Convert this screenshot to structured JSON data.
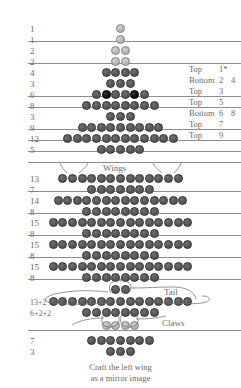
{
  "page": {
    "caption_line1": "Craft the left wing",
    "caption_line2": "as a mirror image"
  },
  "annotations": {
    "wings": "Wings",
    "tail": "Tail",
    "claws": "Claws"
  },
  "colors": {
    "bead_dark": "#585858",
    "bead_black": "#121212",
    "bead_light": "#b8b8b8",
    "rule": "#8d8d8d",
    "text": "#6a6a6a",
    "background": "#ffffff"
  },
  "rows": [
    {
      "count_label": "1",
      "beads": [
        "light"
      ],
      "y": 24,
      "cx": 120.5,
      "rule_below": false
    },
    {
      "count_label": "1",
      "beads": [
        "light"
      ],
      "y": 35,
      "cx": 120.5,
      "rule_below": true
    },
    {
      "count_label": "2",
      "beads": [
        "light",
        "light"
      ],
      "y": 46,
      "cx": 120.5,
      "rule_below": false
    },
    {
      "count_label": "2",
      "beads": [
        "light",
        "light"
      ],
      "y": 57,
      "cx": 120.5,
      "rule_below": true
    },
    {
      "count_label": "4",
      "beads": [
        "dark",
        "dark",
        "dark",
        "dark"
      ],
      "y": 68,
      "cx": 120.5,
      "rule_below": false
    },
    {
      "count_label": "3",
      "beads": [
        "dark",
        "dark",
        "dark"
      ],
      "y": 79,
      "cx": 120.5,
      "rule_below": false
    },
    {
      "count_label": "6",
      "beads": [
        "dark",
        "black",
        "dark",
        "dark",
        "black",
        "dark"
      ],
      "y": 90,
      "cx": 120.5,
      "rule_below": true
    },
    {
      "count_label": "8",
      "beads": [
        "dark",
        "dark",
        "dark",
        "dark",
        "dark",
        "dark",
        "dark",
        "dark"
      ],
      "y": 101,
      "cx": 120.5,
      "rule_below": false
    },
    {
      "count_label": "3",
      "beads": [
        "dark",
        "dark",
        "dark"
      ],
      "y": 112,
      "cx": 120.5,
      "rule_below": false
    },
    {
      "count_label": "9",
      "beads": [
        "dark",
        "dark",
        "dark",
        "dark",
        "dark",
        "dark",
        "dark",
        "dark",
        "dark"
      ],
      "y": 123,
      "cx": 120.5,
      "rule_below": true
    },
    {
      "count_label": "12",
      "beads": [
        "dark",
        "dark",
        "dark",
        "dark",
        "dark",
        "dark",
        "dark",
        "dark",
        "dark",
        "dark",
        "dark",
        "dark"
      ],
      "y": 134,
      "cx": 120.5,
      "rule_below": false
    },
    {
      "count_label": "5",
      "beads": [
        "dark",
        "dark",
        "dark",
        "dark",
        "dark"
      ],
      "y": 145,
      "cx": 120.5,
      "rule_below": true
    },
    {
      "count_label": "13",
      "beads": [
        "dark",
        "dark",
        "dark",
        "dark",
        "dark",
        "dark",
        "dark",
        "dark",
        "dark",
        "dark",
        "dark",
        "dark",
        "dark"
      ],
      "y": 174,
      "cx": 120.5,
      "rule_below": false
    },
    {
      "count_label": "7",
      "beads": [
        "dark",
        "dark",
        "dark",
        "dark",
        "dark",
        "dark",
        "dark"
      ],
      "y": 185,
      "cx": 120.5,
      "rule_below": true
    },
    {
      "count_label": "14",
      "beads": [
        "dark",
        "dark",
        "dark",
        "dark",
        "dark",
        "dark",
        "dark",
        "dark",
        "dark",
        "dark",
        "dark",
        "dark",
        "dark",
        "dark"
      ],
      "y": 196,
      "cx": 120.5,
      "rule_below": false
    },
    {
      "count_label": "8",
      "beads": [
        "dark",
        "dark",
        "dark",
        "dark",
        "dark",
        "dark",
        "dark",
        "dark"
      ],
      "y": 207,
      "cx": 120.5,
      "rule_below": true
    },
    {
      "count_label": "15",
      "beads": [
        "dark",
        "dark",
        "dark",
        "dark",
        "dark",
        "dark",
        "dark",
        "dark",
        "dark",
        "dark",
        "dark",
        "dark",
        "dark",
        "dark",
        "dark"
      ],
      "y": 218,
      "cx": 120.5,
      "rule_below": false
    },
    {
      "count_label": "8",
      "beads": [
        "dark",
        "dark",
        "dark",
        "dark",
        "dark",
        "dark",
        "dark",
        "dark"
      ],
      "y": 229,
      "cx": 120.5,
      "rule_below": true
    },
    {
      "count_label": "15",
      "beads": [
        "dark",
        "dark",
        "dark",
        "dark",
        "dark",
        "dark",
        "dark",
        "dark",
        "dark",
        "dark",
        "dark",
        "dark",
        "dark",
        "dark",
        "dark"
      ],
      "y": 240,
      "cx": 120.5,
      "rule_below": false
    },
    {
      "count_label": "8",
      "beads": [
        "dark",
        "dark",
        "dark",
        "dark",
        "dark",
        "dark",
        "dark",
        "dark"
      ],
      "y": 251,
      "cx": 120.5,
      "rule_below": true
    },
    {
      "count_label": "15",
      "beads": [
        "dark",
        "dark",
        "dark",
        "dark",
        "dark",
        "dark",
        "dark",
        "dark",
        "dark",
        "dark",
        "dark",
        "dark",
        "dark",
        "dark",
        "dark"
      ],
      "y": 262,
      "cx": 120.5,
      "rule_below": false
    },
    {
      "count_label": "8",
      "beads": [
        "dark",
        "dark",
        "dark",
        "dark",
        "dark",
        "dark",
        "dark",
        "dark"
      ],
      "y": 273,
      "cx": 120.5,
      "rule_below": true
    },
    {
      "count_label": "",
      "beads": [
        "dark",
        "dark"
      ],
      "y": 285,
      "cx": 120.5,
      "rule_below": false
    },
    {
      "count_label": "13+2",
      "beads": [
        "dark",
        "dark",
        "dark",
        "dark",
        "dark",
        "dark",
        "dark",
        "dark",
        "dark",
        "dark",
        "dark",
        "dark",
        "dark",
        "dark",
        "dark"
      ],
      "y": 297,
      "cx": 120.5,
      "rule_below": false
    },
    {
      "count_label": "6+2+2",
      "beads": [
        "dark",
        "dark",
        "dark",
        "dark",
        "dark",
        "dark",
        "dark",
        "dark"
      ],
      "y": 308,
      "cx": 120.5,
      "rule_below": false
    },
    {
      "count_label": "",
      "beads": [
        "light",
        "light",
        "light",
        "light"
      ],
      "y": 321,
      "cx": 120.5,
      "rule_below": true
    },
    {
      "count_label": "7",
      "beads": [
        "dark",
        "dark",
        "dark",
        "dark",
        "dark",
        "dark",
        "dark"
      ],
      "y": 336,
      "cx": 120.5,
      "rule_below": false
    },
    {
      "count_label": "3",
      "beads": [
        "dark",
        "dark",
        "dark"
      ],
      "y": 347,
      "cx": 120.5,
      "rule_below": false
    }
  ],
  "side_labels": [
    {
      "side": "Top",
      "n1": "1*",
      "n2": "",
      "y": 65
    },
    {
      "side": "Bottom",
      "n1": "2",
      "n2": "4",
      "y": 76
    },
    {
      "side": "Top",
      "n1": "3",
      "n2": "",
      "y": 87
    },
    {
      "side": "Top",
      "n1": "5",
      "n2": "",
      "y": 98
    },
    {
      "side": "Bottom",
      "n1": "6",
      "n2": "8",
      "y": 109
    },
    {
      "side": "Top",
      "n1": "7",
      "n2": "",
      "y": 120
    },
    {
      "side": "Top",
      "n1": "9",
      "n2": "",
      "y": 131
    }
  ],
  "rules": [
    {
      "y": 41,
      "x": 28,
      "w": 213
    },
    {
      "y": 63,
      "x": 28,
      "w": 213
    },
    {
      "y": 96,
      "x": 28,
      "w": 213
    },
    {
      "y": 107,
      "x": 28,
      "w": 213
    },
    {
      "y": 129,
      "x": 28,
      "w": 213
    },
    {
      "y": 140,
      "x": 28,
      "w": 213
    },
    {
      "y": 151,
      "x": 28,
      "w": 213
    },
    {
      "y": 162,
      "x": 28,
      "w": 213
    },
    {
      "y": 191,
      "x": 28,
      "w": 213
    },
    {
      "y": 213,
      "x": 28,
      "w": 213
    },
    {
      "y": 235,
      "x": 28,
      "w": 213
    },
    {
      "y": 257,
      "x": 28,
      "w": 213
    },
    {
      "y": 279,
      "x": 28,
      "w": 213
    },
    {
      "y": 330,
      "x": 28,
      "w": 213
    }
  ]
}
